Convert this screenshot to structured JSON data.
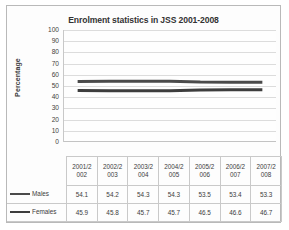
{
  "chart_data": {
    "type": "line",
    "title": "Enrolment statistics in JSS 2001-2008",
    "xlabel": "",
    "ylabel": "Percentage",
    "ylim": [
      0,
      100
    ],
    "yticks": [
      100,
      90,
      80,
      70,
      60,
      50,
      40,
      30,
      20,
      10,
      0
    ],
    "grid": true,
    "legend_position": "data-table-left",
    "categories": [
      "2001/2002",
      "2002/2003",
      "2003/2004",
      "2004/2005",
      "2005/2006",
      "2006/2007",
      "2007/2008"
    ],
    "category_lines": [
      [
        "2001/2",
        "002"
      ],
      [
        "2002/2",
        "003"
      ],
      [
        "2003/2",
        "004"
      ],
      [
        "2004/2",
        "005"
      ],
      [
        "2005/2",
        "006"
      ],
      [
        "2006/2",
        "007"
      ],
      [
        "2007/2",
        "008"
      ]
    ],
    "series": [
      {
        "name": "Males",
        "color": "#4a4a4a",
        "values": [
          54.1,
          54.2,
          54.3,
          54.3,
          53.5,
          53.4,
          53.3
        ]
      },
      {
        "name": "Females",
        "color": "#3d3d3d",
        "values": [
          45.9,
          45.8,
          45.7,
          45.7,
          46.5,
          46.6,
          46.7
        ]
      }
    ]
  },
  "colors": {
    "frame_border": "#b9b9b9",
    "gridline": "#dcdcdc",
    "axis": "#c8c8c8",
    "text": "#3c3c3c"
  }
}
